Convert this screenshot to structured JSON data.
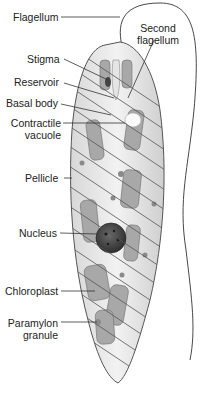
{
  "figure": {
    "labels": [
      {
        "id": "flagellum",
        "text": "Flagellum"
      },
      {
        "id": "second-flagellum",
        "line1": "Second",
        "line2": "flagellum"
      },
      {
        "id": "stigma",
        "text": "Stigma"
      },
      {
        "id": "reservoir",
        "text": "Reservoir"
      },
      {
        "id": "basal-body",
        "text": "Basal body"
      },
      {
        "id": "contractile-vacuole",
        "line1": "Contractile",
        "line2": "vacuole"
      },
      {
        "id": "pellicle",
        "text": "Pellicle"
      },
      {
        "id": "nucleus",
        "text": "Nucleus"
      },
      {
        "id": "chloroplast",
        "text": "Chloroplast"
      },
      {
        "id": "paramylon-granule",
        "line1": "Paramylon",
        "line2": "granule"
      }
    ]
  }
}
